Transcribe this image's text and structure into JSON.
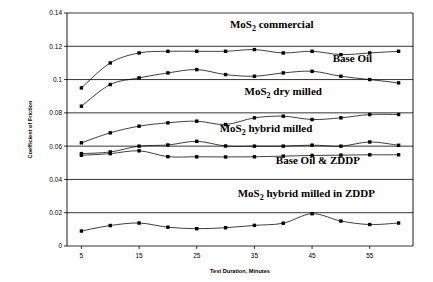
{
  "chart_data": {
    "type": "line",
    "title": "",
    "xlabel": "Test Duration, Minutes",
    "ylabel": "Coefficient of Friction",
    "xlim": [
      2.5,
      62.5
    ],
    "ylim": [
      0,
      0.14
    ],
    "xticks": [
      5,
      15,
      25,
      35,
      45,
      55
    ],
    "yticks": [
      0,
      0.02,
      0.04,
      0.06,
      0.08,
      0.1,
      0.12,
      0.14
    ],
    "ytick_labels": [
      "0",
      "0.02",
      "0.04",
      "0.06",
      "0.08",
      "0.1",
      "0.12",
      "0.14"
    ],
    "xtick_labels": [
      "5",
      "15",
      "25",
      "35",
      "45",
      "55"
    ],
    "grid": true,
    "legend_position": "inline-annotations",
    "x": [
      5,
      10,
      15,
      20,
      25,
      30,
      35,
      40,
      45,
      50,
      55,
      60
    ],
    "series": [
      {
        "name": "MoS2 commercial",
        "label_html": "MoS<sub>2</sub> commercial",
        "label_main": "MoS",
        "label_sub": "2",
        "label_rest": " commercial",
        "values": [
          0.095,
          0.11,
          0.116,
          0.117,
          0.117,
          0.117,
          0.118,
          0.116,
          0.117,
          0.115,
          0.116,
          0.117
        ],
        "annotation_x": 38,
        "annotation_y": 0.131
      },
      {
        "name": "Base Oil",
        "label_html": "Base Oil",
        "label_main": "Base Oil",
        "label_sub": "",
        "label_rest": "",
        "values": [
          0.084,
          0.097,
          0.101,
          0.104,
          0.106,
          0.103,
          0.102,
          0.104,
          0.105,
          0.102,
          0.1,
          0.098
        ],
        "annotation_x": 52,
        "annotation_y": 0.1105
      },
      {
        "name": "MoS2 dry milled",
        "label_html": "MoS<sub>2</sub> dry milled",
        "label_main": "MoS",
        "label_sub": "2",
        "label_rest": " dry milled",
        "values": [
          0.062,
          0.068,
          0.072,
          0.074,
          0.075,
          0.073,
          0.077,
          0.078,
          0.076,
          0.077,
          0.079,
          0.079
        ],
        "annotation_x": 40,
        "annotation_y": 0.0905
      },
      {
        "name": "MoS2 hybrid milled",
        "label_html": "MoS<sub>2</sub> hybrid milled",
        "label_main": "MoS",
        "label_sub": "2",
        "label_rest": " hybrid milled",
        "values": [
          0.0555,
          0.0565,
          0.06,
          0.0607,
          0.0629,
          0.0601,
          0.06,
          0.06,
          0.0606,
          0.06,
          0.0625,
          0.0605
        ],
        "annotation_x": 37,
        "annotation_y": 0.0682
      },
      {
        "name": "Base Oil & ZDDP",
        "label_html": "Base Oil &amp; ZDDP",
        "label_main": "Base Oil  &  ZDDP",
        "label_sub": "",
        "label_rest": "",
        "values": [
          0.0545,
          0.0555,
          0.0572,
          0.0537,
          0.0536,
          0.0535,
          0.0536,
          0.054,
          0.0544,
          0.0546,
          0.0548,
          0.0548
        ],
        "annotation_x": 46,
        "annotation_y": 0.0495
      },
      {
        "name": "MoS2 hybrid milled in ZDDP",
        "label_html": "MoS<sub>2</sub> hybrid milled in ZDDP",
        "label_main": "MoS",
        "label_sub": "2",
        "label_rest": " hybrid milled in ZDDP",
        "values": [
          0.009,
          0.0123,
          0.0138,
          0.0113,
          0.0104,
          0.011,
          0.0124,
          0.0137,
          0.0194,
          0.015,
          0.0129,
          0.0138
        ],
        "annotation_x": 44,
        "annotation_y": 0.0295
      }
    ]
  }
}
